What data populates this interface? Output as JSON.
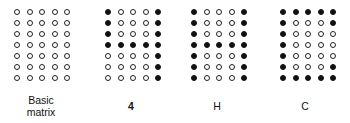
{
  "figure": {
    "matrices": [
      {
        "label": "Basic matrix",
        "label_lines": [
          "Basic",
          "matrix"
        ],
        "rows": [
          [
            0,
            0,
            0,
            0,
            0
          ],
          [
            0,
            0,
            0,
            0,
            0
          ],
          [
            0,
            0,
            0,
            0,
            0
          ],
          [
            0,
            0,
            0,
            0,
            0
          ],
          [
            0,
            0,
            0,
            0,
            0
          ],
          [
            0,
            0,
            0,
            0,
            0
          ],
          [
            0,
            0,
            0,
            0,
            0
          ]
        ]
      },
      {
        "label": "4",
        "label_lines": [
          "4"
        ],
        "rows": [
          [
            1,
            0,
            0,
            0,
            1
          ],
          [
            1,
            0,
            0,
            0,
            1
          ],
          [
            1,
            0,
            0,
            0,
            1
          ],
          [
            1,
            1,
            1,
            1,
            1
          ],
          [
            0,
            0,
            0,
            0,
            1
          ],
          [
            0,
            0,
            0,
            0,
            1
          ],
          [
            0,
            0,
            0,
            0,
            1
          ]
        ]
      },
      {
        "label": "H",
        "label_lines": [
          "H"
        ],
        "rows": [
          [
            1,
            0,
            0,
            0,
            1
          ],
          [
            1,
            0,
            0,
            0,
            1
          ],
          [
            1,
            0,
            0,
            0,
            1
          ],
          [
            1,
            1,
            1,
            1,
            1
          ],
          [
            1,
            0,
            0,
            0,
            1
          ],
          [
            1,
            0,
            0,
            0,
            1
          ],
          [
            1,
            0,
            0,
            0,
            1
          ]
        ]
      },
      {
        "label": "C",
        "label_lines": [
          "C"
        ],
        "rows": [
          [
            1,
            1,
            1,
            1,
            1
          ],
          [
            1,
            0,
            0,
            0,
            1
          ],
          [
            1,
            0,
            0,
            0,
            0
          ],
          [
            1,
            0,
            0,
            0,
            0
          ],
          [
            1,
            0,
            0,
            0,
            0
          ],
          [
            1,
            0,
            0,
            0,
            1
          ],
          [
            1,
            1,
            1,
            1,
            1
          ]
        ]
      }
    ],
    "colors": {
      "dot_on": "#111111",
      "dot_off_border": "#222222",
      "background": "#ffffff"
    }
  }
}
